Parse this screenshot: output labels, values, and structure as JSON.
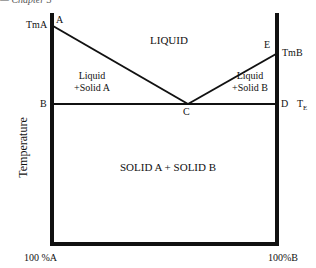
{
  "caption": "— Chapter 3",
  "diagram": {
    "y_axis_label": "Temperature",
    "x_axis": {
      "left_label": "100 %A",
      "right_label": "100%B"
    },
    "points": {
      "A": "A",
      "B": "B",
      "C": "C",
      "D": "D",
      "E": "E"
    },
    "temperatures": {
      "tma": "TmA",
      "tmb": "TmB",
      "te_main": "T",
      "te_sub": "E"
    },
    "regions": {
      "liquid": "LIQUID",
      "liquid_solid_a_line1": "Liquid",
      "liquid_solid_a_line2": "+Solid A",
      "liquid_solid_b_line1": "Liquid",
      "liquid_solid_b_line2": "+Solid B",
      "solid": "SOLID A + SOLID B"
    },
    "colors": {
      "line": "#111111",
      "background": "#ffffff"
    }
  }
}
